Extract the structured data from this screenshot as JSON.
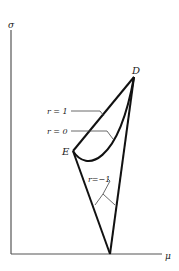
{
  "figure": {
    "axes": {
      "y_label": "σ",
      "x_label": "μ"
    },
    "points": {
      "D": {
        "label": "D"
      },
      "E": {
        "label": "E"
      }
    },
    "curves": [
      {
        "id": "r1",
        "label": "r = 1",
        "description": "straight line from E to D"
      },
      {
        "id": "r0",
        "label": "r = 0",
        "description": "convex curve from E to D below r=1 line"
      },
      {
        "id": "rneg1",
        "label": "r=−1",
        "description": "two straight segments E to μ-axis and μ-axis to D"
      }
    ]
  }
}
